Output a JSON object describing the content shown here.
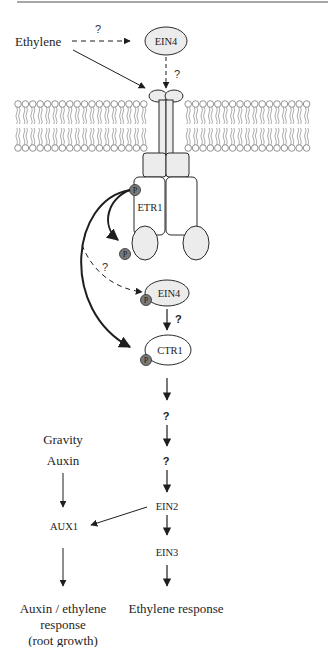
{
  "header_rule": {
    "color": "#8a8a8a"
  },
  "inputs": {
    "ethylene": "Ethylene",
    "gravity": "Gravity",
    "auxin": "Auxin"
  },
  "proteins": {
    "ein4_top": "EIN4",
    "etr1": "ETR1",
    "ein4_lower": "EIN4",
    "ctr1": "CTR1",
    "ein2": "EIN2",
    "ein3": "EIN3",
    "aux1": "AUX1"
  },
  "phospho_label": "P",
  "unknowns": {
    "ethylene_to_ein4": "?",
    "ein4_to_receptor": "?",
    "etr1_to_ein4": "?",
    "ein4_to_ctr1": "?",
    "step_1": "?",
    "step_2": "?"
  },
  "outputs": {
    "auxin_ethylene_line1": "Auxin / ethylene",
    "auxin_ethylene_line2": "response",
    "auxin_ethylene_line3": "(root growth)",
    "ethylene_response": "Ethylene response"
  },
  "colors": {
    "ink": "#1e1e1e",
    "protein_fill": "#ececec",
    "phospho_fill": "#7a7a7a",
    "lipid_stroke": "#777777"
  }
}
